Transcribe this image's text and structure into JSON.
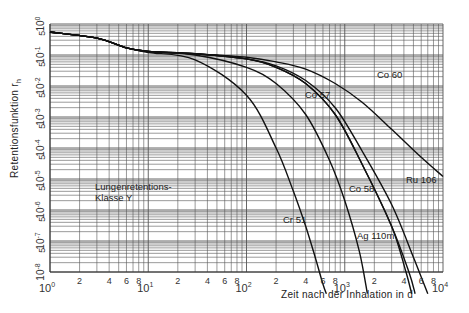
{
  "chart_data": {
    "type": "line",
    "title": "",
    "xlabel": "Zeit nach der Inhalation in d",
    "ylabel": "Retentionsfunktion r_h",
    "ylabel_main": "Retentionsfunktion r",
    "ylabel_sub": "h",
    "xscale": "log",
    "yscale": "log",
    "xlim": [
      1,
      10000
    ],
    "ylim": [
      1e-08,
      1
    ],
    "grid": true,
    "legend": "inline labels",
    "annotation": [
      "Lungenretentions-",
      "Klasse Y"
    ],
    "x_tick_labels": [
      {
        "base": "10",
        "exp": "0"
      },
      {
        "minor": "2"
      },
      {
        "minor": "4"
      },
      {
        "minor": "6"
      },
      {
        "minor": "8"
      },
      {
        "base": "10",
        "exp": "1"
      },
      {
        "minor": "2"
      },
      {
        "minor": "4"
      },
      {
        "minor": "6"
      },
      {
        "minor": "8"
      },
      {
        "base": "10",
        "exp": "2"
      },
      {
        "minor": "2"
      },
      {
        "minor": "4"
      },
      {
        "minor": "6"
      },
      {
        "minor": "8"
      },
      {
        "base": "10",
        "exp": "3"
      },
      {
        "minor": "2"
      },
      {
        "minor": "4"
      },
      {
        "minor": "6"
      },
      {
        "minor": "8"
      },
      {
        "base": "10",
        "exp": "4"
      }
    ],
    "y_tick_labels": [
      "10^0",
      "5",
      "10^-1",
      "5",
      "10^-2",
      "5",
      "10^-3",
      "5",
      "10^-4",
      "5",
      "10^-5",
      "5",
      "10^-6",
      "5",
      "10^-7",
      "5",
      "10^-8"
    ],
    "series": [
      {
        "name": "Co 60",
        "x": [
          1,
          3,
          6,
          10,
          30,
          100,
          200,
          400,
          800,
          1500,
          3000,
          6000,
          10000
        ],
        "y": [
          0.55,
          0.35,
          0.17,
          0.13,
          0.11,
          0.085,
          0.06,
          0.035,
          0.012,
          0.003,
          0.0004,
          5e-05,
          1.2e-05
        ]
      },
      {
        "name": "Ru 106",
        "x": [
          1,
          3,
          6,
          10,
          30,
          100,
          200,
          400,
          800,
          1500,
          3000,
          5000,
          7000
        ],
        "y": [
          0.55,
          0.35,
          0.17,
          0.13,
          0.11,
          0.075,
          0.045,
          0.015,
          0.002,
          8e-05,
          1.5e-06,
          3e-08,
          2e-09
        ]
      },
      {
        "name": "Ag 110m",
        "x": [
          1,
          3,
          6,
          10,
          30,
          100,
          200,
          400,
          800,
          1500,
          3000,
          4500,
          5200
        ],
        "y": [
          0.55,
          0.35,
          0.17,
          0.13,
          0.11,
          0.075,
          0.04,
          0.012,
          0.0012,
          3e-05,
          3e-07,
          1e-08,
          2e-09
        ]
      },
      {
        "name": "Co 57",
        "x": [
          1,
          3,
          6,
          10,
          30,
          100,
          200,
          400,
          800,
          1500,
          3000,
          4200,
          4800
        ],
        "y": [
          0.55,
          0.35,
          0.17,
          0.13,
          0.11,
          0.075,
          0.04,
          0.012,
          0.0012,
          3e-05,
          3e-07,
          1e-08,
          2e-09
        ]
      },
      {
        "name": "Co 58",
        "x": [
          1,
          3,
          6,
          10,
          30,
          100,
          200,
          400,
          700,
          1000,
          1400,
          1700
        ],
        "y": [
          0.55,
          0.35,
          0.17,
          0.13,
          0.1,
          0.04,
          0.012,
          0.0012,
          4e-05,
          2e-06,
          5e-08,
          2e-09
        ]
      },
      {
        "name": "Cr 51",
        "x": [
          1,
          3,
          6,
          10,
          30,
          100,
          200,
          300,
          400,
          500,
          600,
          650
        ],
        "y": [
          0.55,
          0.35,
          0.17,
          0.12,
          0.07,
          0.005,
          0.0001,
          4e-06,
          3e-07,
          3e-08,
          4e-09,
          2e-09
        ]
      }
    ],
    "labels": [
      {
        "text": "Co 60",
        "x": 1800,
        "y": 0.012
      },
      {
        "text": "Co 57",
        "x": 230,
        "y": 0.0045
      },
      {
        "text": "Co 58",
        "x": 900,
        "y": 1.2e-06
      },
      {
        "text": "Ru 106",
        "x": 3500,
        "y": 3e-06
      },
      {
        "text": "Cr 51",
        "x": 280,
        "y": 7e-08
      },
      {
        "text": "Ag 110m",
        "x": 700,
        "y": 7e-09
      }
    ]
  },
  "labels": {
    "co60": "Co 60",
    "co57": "Co 57",
    "co58": "Co 58",
    "ru106": "Ru 106",
    "cr51": "Cr 51",
    "ag110m": "Ag 110m",
    "annotation_line1": "Lungenretentions-",
    "annotation_line2": "Klasse Y",
    "xlabel": "Zeit nach der Inhalation in d",
    "ylabel_main": "Retentionsfunktion r",
    "ylabel_sub": "h"
  },
  "colors": {
    "grid": "#555555",
    "curve": "#111111",
    "text": "#222222"
  }
}
